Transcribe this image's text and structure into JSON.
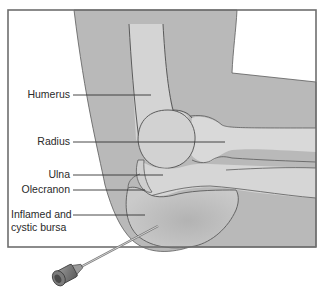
{
  "diagram": {
    "labels": [
      {
        "id": "humerus",
        "text": "Humerus"
      },
      {
        "id": "radius",
        "text": "Radius"
      },
      {
        "id": "ulna",
        "text": "Ulna"
      },
      {
        "id": "olecranon",
        "text": "Olecranon"
      },
      {
        "id": "bursa_line1",
        "text": "Inflamed and"
      },
      {
        "id": "bursa_line2",
        "text": "cystic bursa"
      }
    ],
    "colors": {
      "frame": "#6e6e6e",
      "skin": "#b9b9b9",
      "bone": "#d6d6d6",
      "bursa": "#c3c3c3",
      "outline": "#5c5c5c",
      "leader": "#333333",
      "needle_hub": "#8a8a8a"
    }
  }
}
